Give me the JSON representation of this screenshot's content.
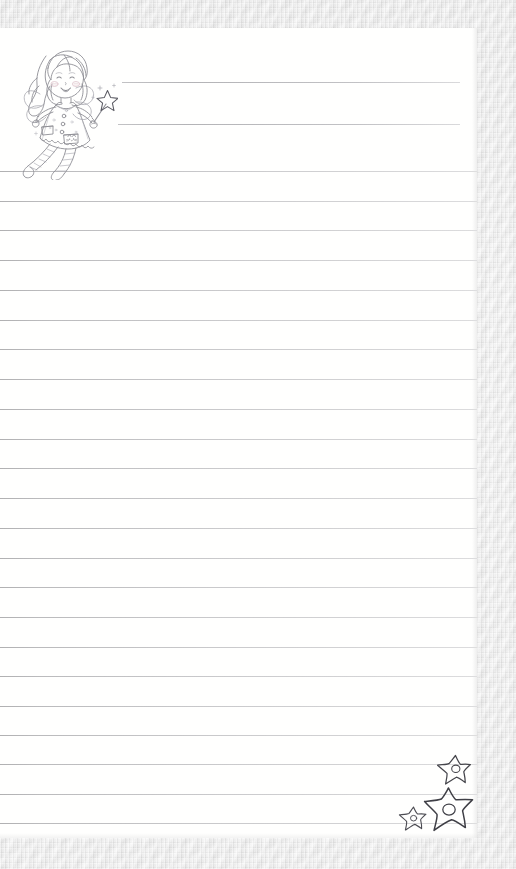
{
  "document": {
    "kind": "lined-writing-paper",
    "title": "Fairy Girl Lined Stationery",
    "orientation": "portrait",
    "paper_color": "#fffffe",
    "mat_color": "#ebebeb",
    "rule_color": "#a0a0a4"
  },
  "paper": {
    "left": 0,
    "top": 28,
    "width": 477,
    "height": 810
  },
  "header": {
    "short_rules": [
      {
        "left": 122,
        "top": 54,
        "width": 338
      },
      {
        "left": 118,
        "top": 96,
        "width": 342
      }
    ]
  },
  "body_rules": {
    "count": 22,
    "spacing": 29.8,
    "first_top": 143,
    "tops": [
      143,
      173,
      202,
      232,
      262,
      292,
      321,
      351,
      381,
      411,
      440,
      470,
      500,
      530,
      559,
      589,
      619,
      648,
      678,
      707,
      736,
      766,
      795
    ]
  },
  "illustration": {
    "name": "fairy-girl",
    "description": "hand-drawn coloring-book style fairy girl with wavy hair, wings, pocketed dress, striped stockings and a star wand",
    "left": 6,
    "top": 0,
    "width": 112,
    "height": 152,
    "ink_color": "#8c8c92",
    "blush_color": "#d9b9c2"
  },
  "decorations": {
    "stars": [
      {
        "name": "star-top-right",
        "left": 435,
        "top": 753,
        "size": 38
      },
      {
        "name": "star-large",
        "left": 423,
        "top": 786,
        "size": 52
      },
      {
        "name": "star-small-left",
        "left": 398,
        "top": 805,
        "size": 30
      }
    ],
    "star_ink_color": "#4a4a50"
  }
}
